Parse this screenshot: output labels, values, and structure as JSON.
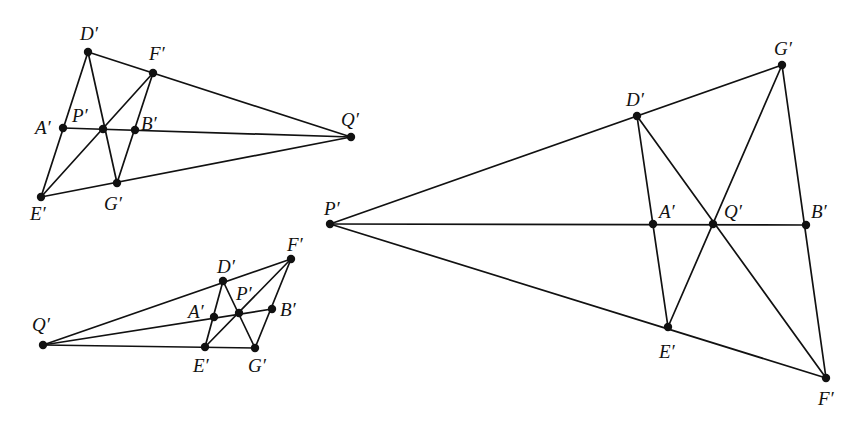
{
  "diagrams": [
    {
      "id": "left-top",
      "points": {
        "D": {
          "label": "D′",
          "x": 88,
          "y": 52,
          "lx": 80,
          "ly": 40
        },
        "F": {
          "label": "F′",
          "x": 153,
          "y": 73,
          "lx": 149,
          "ly": 60
        },
        "A": {
          "label": "A′",
          "x": 63,
          "y": 128,
          "lx": 35,
          "ly": 134
        },
        "P": {
          "label": "P′",
          "x": 103,
          "y": 129,
          "lx": 72,
          "ly": 122
        },
        "B": {
          "label": "B′",
          "x": 135,
          "y": 130,
          "lx": 141,
          "ly": 130
        },
        "Q": {
          "label": "Q′",
          "x": 351,
          "y": 137,
          "lx": 341,
          "ly": 126
        },
        "G": {
          "label": "G′",
          "x": 117,
          "y": 183,
          "lx": 104,
          "ly": 210
        },
        "E": {
          "label": "E′",
          "x": 41,
          "y": 197,
          "lx": 30,
          "ly": 220
        }
      },
      "lines": [
        [
          "D",
          "Q"
        ],
        [
          "E",
          "Q"
        ],
        [
          "A",
          "Q"
        ],
        [
          "D",
          "E"
        ],
        [
          "D",
          "G"
        ],
        [
          "F",
          "E"
        ],
        [
          "F",
          "G"
        ]
      ]
    },
    {
      "id": "left-bottom",
      "points": {
        "Q": {
          "label": "Q′",
          "x": 43,
          "y": 345,
          "lx": 32,
          "ly": 331
        },
        "D": {
          "label": "D′",
          "x": 223,
          "y": 281,
          "lx": 217,
          "ly": 273
        },
        "F": {
          "label": "F′",
          "x": 291,
          "y": 259,
          "lx": 287,
          "ly": 251
        },
        "A": {
          "label": "A′",
          "x": 214,
          "y": 317,
          "lx": 188,
          "ly": 318
        },
        "P": {
          "label": "P′",
          "x": 239,
          "y": 313,
          "lx": 236,
          "ly": 300
        },
        "B": {
          "label": "B′",
          "x": 272,
          "y": 309,
          "lx": 280,
          "ly": 316
        },
        "E": {
          "label": "E′",
          "x": 205,
          "y": 347,
          "lx": 193,
          "ly": 372
        },
        "G": {
          "label": "G′",
          "x": 255,
          "y": 348,
          "lx": 248,
          "ly": 372
        }
      },
      "lines": [
        [
          "Q",
          "F"
        ],
        [
          "Q",
          "G"
        ],
        [
          "Q",
          "B"
        ],
        [
          "D",
          "E"
        ],
        [
          "D",
          "G"
        ],
        [
          "F",
          "E"
        ],
        [
          "F",
          "G"
        ]
      ]
    },
    {
      "id": "right",
      "points": {
        "P": {
          "label": "P′",
          "x": 330,
          "y": 224,
          "lx": 324,
          "ly": 215
        },
        "D": {
          "label": "D′",
          "x": 637,
          "y": 116,
          "lx": 626,
          "ly": 106
        },
        "G": {
          "label": "G′",
          "x": 782,
          "y": 65,
          "lx": 774,
          "ly": 55
        },
        "A": {
          "label": "A′",
          "x": 653,
          "y": 224,
          "lx": 659,
          "ly": 218
        },
        "Q": {
          "label": "Q′",
          "x": 713,
          "y": 224,
          "lx": 724,
          "ly": 218
        },
        "B": {
          "label": "B′",
          "x": 806,
          "y": 225,
          "lx": 811,
          "ly": 218
        },
        "E": {
          "label": "E′",
          "x": 668,
          "y": 327,
          "lx": 659,
          "ly": 358
        },
        "F": {
          "label": "F′",
          "x": 826,
          "y": 378,
          "lx": 818,
          "ly": 405
        }
      },
      "lines": [
        [
          "P",
          "G"
        ],
        [
          "P",
          "F"
        ],
        [
          "P",
          "B"
        ],
        [
          "D",
          "E"
        ],
        [
          "D",
          "F"
        ],
        [
          "G",
          "E"
        ],
        [
          "G",
          "F"
        ]
      ]
    }
  ]
}
